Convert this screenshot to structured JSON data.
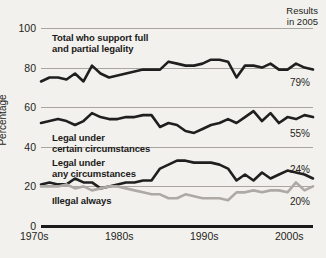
{
  "header": {
    "note": "Results\nin 2005"
  },
  "axes": {
    "ylabel": "Percentage",
    "yticks": [
      "0",
      "20",
      "40",
      "60",
      "80",
      "100"
    ],
    "xticks": [
      "1970s",
      "1980s",
      "1990s",
      "2000s"
    ]
  },
  "series_labels": {
    "total": "Total who support full\nand partial legality",
    "certain": "Legal under\ncertain circumstances",
    "any": "Legal under\nany circumstances",
    "illegal": "Illegal always"
  },
  "end_labels": {
    "total": "79%",
    "certain": "55%",
    "any": "24%",
    "illegal": "20%"
  },
  "colors": {
    "background": "#f3f1ed",
    "dark_line": "#1f1f1f",
    "light_line": "#adaaa6",
    "gridline": "#a9a6a2",
    "text": "#231f20"
  },
  "chart_data": {
    "type": "line",
    "title": "",
    "subtitle": "Results in 2005",
    "xlabel": "",
    "ylabel": "Percentage",
    "ylim": [
      0,
      100
    ],
    "xlim": [
      1973,
      2005
    ],
    "grid": true,
    "legend": "inline-annotations",
    "x": [
      1973,
      1974,
      1975,
      1976,
      1977,
      1978,
      1979,
      1980,
      1981,
      1982,
      1983,
      1984,
      1985,
      1986,
      1987,
      1988,
      1989,
      1990,
      1991,
      1992,
      1993,
      1994,
      1995,
      1996,
      1997,
      1998,
      1999,
      2000,
      2001,
      2002,
      2003,
      2004,
      2005
    ],
    "series": [
      {
        "name": "Total who support full and partial legality",
        "color": "#1f1f1f",
        "end_value": 79,
        "values": [
          73,
          75,
          75,
          74,
          77,
          73,
          81,
          77,
          75,
          76,
          77,
          78,
          79,
          79,
          79,
          83,
          82,
          81,
          81,
          82,
          84,
          84,
          83,
          75,
          81,
          81,
          80,
          82,
          79,
          79,
          82,
          80,
          79
        ]
      },
      {
        "name": "Legal under certain circumstances",
        "color": "#1f1f1f",
        "end_value": 55,
        "values": [
          52,
          53,
          54,
          53,
          51,
          53,
          57,
          55,
          54,
          54,
          55,
          55,
          56,
          56,
          50,
          52,
          51,
          48,
          47,
          49,
          51,
          52,
          54,
          52,
          55,
          58,
          53,
          57,
          52,
          55,
          54,
          56,
          55
        ]
      },
      {
        "name": "Legal under any circumstances",
        "color": "#1f1f1f",
        "end_value": 24,
        "values": [
          21,
          22,
          21,
          21,
          24,
          22,
          22,
          19,
          20,
          21,
          22,
          22,
          23,
          23,
          29,
          31,
          33,
          33,
          32,
          32,
          32,
          31,
          29,
          23,
          26,
          23,
          27,
          24,
          26,
          28,
          27,
          26,
          24
        ]
      },
      {
        "name": "Illegal always",
        "color": "#adaaa6",
        "end_value": 20,
        "values": [
          20,
          20,
          20,
          21,
          19,
          20,
          18,
          19,
          20,
          20,
          19,
          18,
          17,
          16,
          16,
          14,
          14,
          16,
          15,
          14,
          14,
          14,
          13,
          17,
          17,
          18,
          17,
          18,
          18,
          17,
          22,
          18,
          20
        ]
      }
    ]
  }
}
